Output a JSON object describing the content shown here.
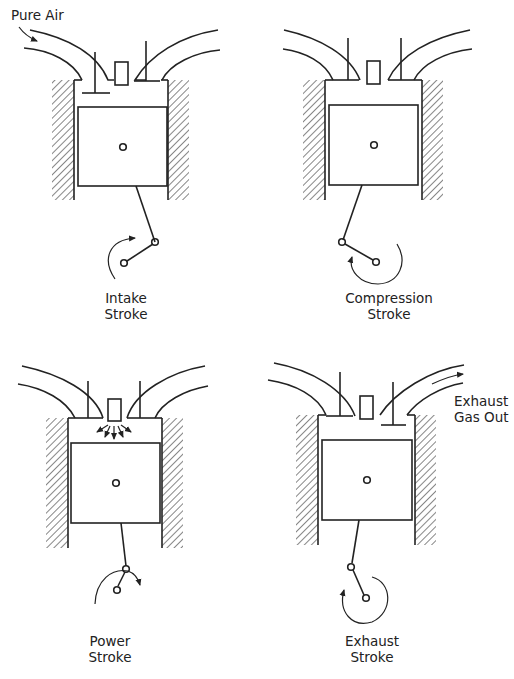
{
  "figure": {
    "colors": {
      "ink": "#222222",
      "background": "#ffffff"
    }
  },
  "panels": [
    {
      "id": "intake",
      "label_line1": "Intake",
      "label_line2": "Stroke",
      "annotation": "Pure Air",
      "offset": [
        0,
        0
      ],
      "intake_valve": "open",
      "exhaust_valve": "closed",
      "crank_pin": [
        154,
        242
      ],
      "crank_center": [
        124,
        264
      ],
      "rotation": "clockwise-arrow-top"
    },
    {
      "id": "compression",
      "label_line1": "Compression",
      "label_line2": "Stroke",
      "annotation": "",
      "offset": [
        258,
        0
      ],
      "intake_valve": "closed",
      "exhaust_valve": "closed",
      "crank_pin": [
        62,
        243
      ],
      "crank_center": [
        96,
        262
      ],
      "rotation": "counterclockwise-arrow-left"
    },
    {
      "id": "power",
      "label_line1": "Power",
      "label_line2": "Stroke",
      "annotation": "",
      "offset": [
        0,
        340
      ],
      "intake_valve": "closed",
      "exhaust_valve": "closed",
      "spark": true,
      "crank_pin": [
        126,
        228
      ],
      "crank_center": [
        116,
        250
      ],
      "rotation": "clockwise-arrow-right"
    },
    {
      "id": "exhaust",
      "label_line1": "Exhaust",
      "label_line2": "Stroke",
      "annotation": "Exhaust Gas Out",
      "annotation_line1": "Exhaust",
      "annotation_line2": "Gas Out",
      "offset": [
        258,
        340
      ],
      "intake_valve": "closed",
      "exhaust_valve": "open",
      "crank_pin": [
        94,
        227
      ],
      "crank_center": [
        110,
        258
      ],
      "rotation": "counterclockwise-arrow-left"
    }
  ],
  "labels": {
    "pure_air": "Pure Air",
    "intake_1": "Intake",
    "intake_2": "Stroke",
    "compression_1": "Compression",
    "compression_2": "Stroke",
    "power_1": "Power",
    "power_2": "Stroke",
    "exhaust_1": "Exhaust",
    "exhaust_2": "Stroke",
    "exhaust_gas_1": "Exhaust",
    "exhaust_gas_2": "Gas Out"
  }
}
